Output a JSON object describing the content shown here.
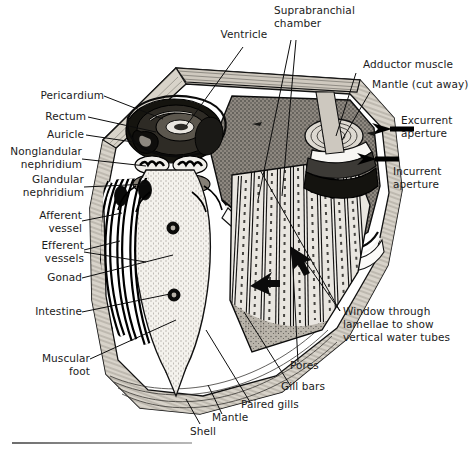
{
  "figure": {
    "background_color": "#ffffff",
    "ink_color": "#1b1b1b",
    "line_color": "#000000",
    "shell_fill": "#cfc9bf",
    "mantle_fill": "#9d968c",
    "visceral_fill": "#f4f2ed",
    "organ_fill": "#7e7870"
  },
  "labels": {
    "ventricle": "Ventricle",
    "suprabranchial_chamber_line1": "Suprabranchial",
    "suprabranchial_chamber_line2": "chamber",
    "adductor_muscle": "Adductor muscle",
    "mantle_cut_away": "Mantle (cut away)",
    "excurrent_aperture_line1": "Excurrent",
    "excurrent_aperture_line2": "aperture",
    "incurrent_aperture_line1": "Incurrent",
    "incurrent_aperture_line2": "aperture",
    "pericardium": "Pericardium",
    "rectum": "Rectum",
    "auricle": "Auricle",
    "nonglandular_nephridium_line1": "Nonglandular",
    "nonglandular_nephridium_line2": "nephridium",
    "glandular_nephridium_line1": "Glandular",
    "glandular_nephridium_line2": "nephridium",
    "afferent_vessel_line1": "Afferent",
    "afferent_vessel_line2": "vessel",
    "efferent_vessels_line1": "Efferent",
    "efferent_vessels_line2": "vessels",
    "gonad": "Gonad",
    "intestine": "Intestine",
    "muscular_foot_line1": "Muscular",
    "muscular_foot_line2": "foot",
    "shell": "Shell",
    "mantle": "Mantle",
    "paired_gills": "Paired gills",
    "gill_bars": "Gill bars",
    "pores": "Pores",
    "window_line1": "Window through",
    "window_line2": "lamellae to show",
    "window_line3": "vertical water tubes"
  }
}
